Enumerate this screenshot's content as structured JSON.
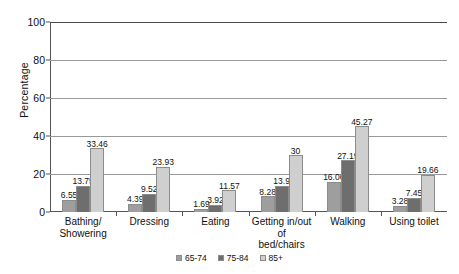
{
  "chart_data": {
    "type": "bar",
    "title": "",
    "xlabel": "",
    "ylabel": "Percentage",
    "ylim": [
      0,
      100
    ],
    "yticks": [
      0,
      20,
      40,
      60,
      80,
      100
    ],
    "grid": true,
    "legend_position": "bottom",
    "categories": [
      "Bathing/ Showering",
      "Dressing",
      "Eating",
      "Getting in/out of bed/chairs",
      "Walking",
      "Using toilet"
    ],
    "category_lines": [
      [
        "Bathing/",
        "Showering"
      ],
      [
        "Dressing"
      ],
      [
        "Eating"
      ],
      [
        "Getting in/out of",
        "bed/chairs"
      ],
      [
        "Walking"
      ],
      [
        "Using toilet"
      ]
    ],
    "series": [
      {
        "name": "65-74",
        "color": "#9e9e9e",
        "values": [
          6.55,
          4.39,
          1.69,
          8.28,
          16.06,
          3.28
        ],
        "labels": [
          "6.55",
          "4.39",
          "1.69",
          "8.28",
          "16.06",
          "3.28"
        ]
      },
      {
        "name": "75-84",
        "color": "#6e6e6e",
        "values": [
          13.75,
          9.52,
          3.92,
          13.9,
          27.19,
          7.45
        ],
        "labels": [
          "13.75",
          "9.52",
          "3.92",
          "13.9",
          "27.19",
          "7.45"
        ]
      },
      {
        "name": "85+",
        "color": "#cfcfcf",
        "values": [
          33.46,
          23.93,
          11.57,
          30,
          45.27,
          19.66
        ],
        "labels": [
          "33.46",
          "23.93",
          "11.57",
          "30",
          "45.27",
          "19.66"
        ]
      }
    ]
  }
}
